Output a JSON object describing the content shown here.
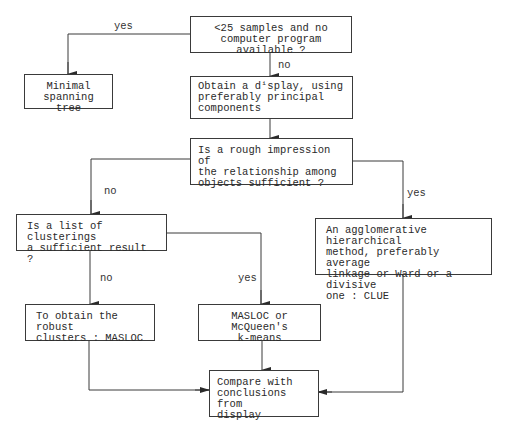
{
  "diagram": {
    "type": "flowchart",
    "nodes": {
      "q_samples": {
        "text": "<25 samples and no\ncomputer program available ?"
      },
      "mst": {
        "text": "Minimal\nspanning tree"
      },
      "display": {
        "text": "Obtain a dⁱsplay, using\npreferably principal\ncomponents"
      },
      "q_rough": {
        "text": "Is a rough impression of\nthe relationship among\nobjects sufficient ?"
      },
      "q_list": {
        "text": "Is a list of clusterings\na sufficient result ?"
      },
      "agglomerative": {
        "text": "An agglomerative hierarchical\nmethod, preferably average\nlinkage or Ward or a divisive\none : CLUE"
      },
      "robust": {
        "text": "To obtain the robust\nclusters : MASLOC"
      },
      "masloc_kmeans": {
        "text": "MASLOC or McQueen's\nk-means"
      },
      "compare": {
        "text": "Compare with\nconclusions from\ndisplay"
      }
    },
    "edge_labels": {
      "samples_yes": "yes",
      "samples_no": "no",
      "rough_no": "no",
      "rough_yes": "yes",
      "list_no": "no",
      "list_yes": "yes"
    },
    "edges": [
      {
        "from": "q_samples",
        "to": "mst",
        "label": "yes"
      },
      {
        "from": "q_samples",
        "to": "display",
        "label": "no"
      },
      {
        "from": "display",
        "to": "q_rough",
        "label": ""
      },
      {
        "from": "q_rough",
        "to": "q_list",
        "label": "no"
      },
      {
        "from": "q_rough",
        "to": "agglomerative",
        "label": "yes"
      },
      {
        "from": "q_list",
        "to": "robust",
        "label": "no"
      },
      {
        "from": "q_list",
        "to": "masloc_kmeans",
        "label": "yes"
      },
      {
        "from": "robust",
        "to": "compare",
        "label": ""
      },
      {
        "from": "masloc_kmeans",
        "to": "compare",
        "label": ""
      },
      {
        "from": "agglomerative",
        "to": "compare",
        "label": ""
      }
    ]
  },
  "colors": {
    "line": "#3a3a3a",
    "text": "#2a2a2a",
    "background": "#ffffff"
  }
}
